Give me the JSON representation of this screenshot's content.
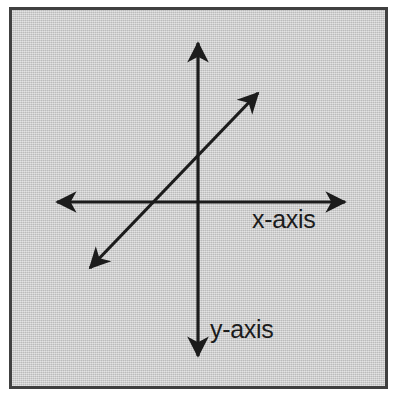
{
  "figure": {
    "background_color": "#c9c9c9",
    "border_color": "#404040",
    "stroke_color": "#1c1c1c",
    "page_color": "#ffffff"
  },
  "labels": {
    "x_axis": "x-axis",
    "y_axis": "y-axis"
  },
  "chart_data": {
    "type": "line",
    "xlabel": "x-axis",
    "ylabel": "y-axis",
    "grid": false,
    "legend": null,
    "origin": {
      "x": 198,
      "y": 202
    },
    "axes": [
      {
        "name": "x-axis",
        "label": "x-axis",
        "orientation": "horizontal",
        "from": {
          "x": 57,
          "y": 202
        },
        "to": {
          "x": 345,
          "y": 202
        },
        "arrow_start": true,
        "arrow_end": true,
        "label_position": {
          "x": 252,
          "y": 207
        }
      },
      {
        "name": "y-axis",
        "label": "y-axis",
        "orientation": "vertical",
        "from": {
          "x": 198,
          "y": 43
        },
        "to": {
          "x": 198,
          "y": 356
        },
        "arrow_start": true,
        "arrow_end": true,
        "label_position": {
          "x": 210,
          "y": 317
        }
      }
    ],
    "series": [
      {
        "name": "line",
        "slope": "positive",
        "arrow_start": true,
        "arrow_end": true,
        "from": {
          "x": 90,
          "y": 268
        },
        "to": {
          "x": 258,
          "y": 93
        },
        "x_intercept": {
          "x": 152,
          "y": 202
        },
        "y_intercept": {
          "x": 198,
          "y": 154
        }
      }
    ]
  }
}
